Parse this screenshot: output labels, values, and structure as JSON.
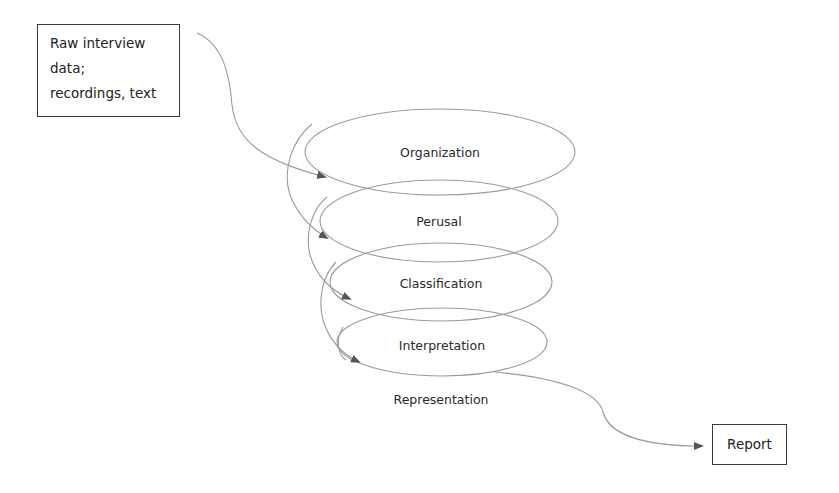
{
  "diagram": {
    "type": "spiral-process",
    "input": {
      "lines": [
        "Raw interview",
        "data;",
        "recordings, text"
      ]
    },
    "stages": [
      {
        "label": "Organization",
        "cx": 440,
        "cy": 152,
        "rx": 135,
        "ry": 43
      },
      {
        "label": "Perusal",
        "cx": 439,
        "cy": 221,
        "rx": 119,
        "ry": 41
      },
      {
        "label": "Classification",
        "cx": 441,
        "cy": 282,
        "rx": 111,
        "ry": 39
      },
      {
        "label": "Interpretation",
        "cx": 442,
        "cy": 342,
        "rx": 105,
        "ry": 34
      },
      {
        "label": "Representation",
        "cx": 441,
        "cy": 399
      }
    ],
    "output": {
      "label": "Report"
    },
    "colors": {
      "line": "#9a9a9a",
      "arrow": "#555555",
      "box_border": "#3a3a3a",
      "text": "#2a2a2a"
    }
  }
}
